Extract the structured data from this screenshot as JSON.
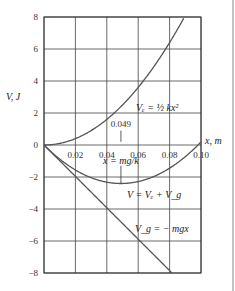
{
  "chart_data": {
    "type": "line",
    "title": "",
    "xlabel": "x, m",
    "ylabel": "V, J",
    "xlim": [
      0,
      0.1
    ],
    "ylim": [
      -8,
      8
    ],
    "grid": true,
    "x_ticks": [
      "0.02",
      "0.04",
      "0.06",
      "0.08",
      "0.10"
    ],
    "y_ticks": [
      "8",
      "6",
      "4",
      "2",
      "0",
      "−2",
      "−4",
      "−6",
      "−8"
    ],
    "series": [
      {
        "name": "V_e = ½ kx²",
        "x": [
          0,
          0.02,
          0.04,
          0.06,
          0.08,
          0.0894
        ],
        "values": [
          0,
          0.4,
          1.6,
          3.6,
          6.4,
          8.0
        ]
      },
      {
        "name": "V_g = − mgx",
        "x": [
          0,
          0.02,
          0.04,
          0.06,
          0.08,
          0.0815
        ],
        "values": [
          0,
          -1.96,
          -3.92,
          -5.89,
          -7.85,
          -8.0
        ]
      },
      {
        "name": "V = V_e + V_g",
        "x": [
          0,
          0.02,
          0.049,
          0.08,
          0.098,
          0.1
        ],
        "values": [
          0,
          -1.56,
          -2.4,
          -1.45,
          0,
          0.19
        ]
      }
    ],
    "annotations": [
      {
        "text": "0.049",
        "x": 0.049
      },
      {
        "text": "x = mg/k"
      }
    ]
  },
  "labels": {
    "ylabel": "V, J",
    "xlabel": "x, m",
    "annotation_value": "0.049",
    "annotation_formula": "x = mg/k",
    "ve_label": "Vₑ = ½ kx²",
    "vg_label": "V_g = − mgx",
    "v_label": "V = Vₑ + V_g"
  }
}
